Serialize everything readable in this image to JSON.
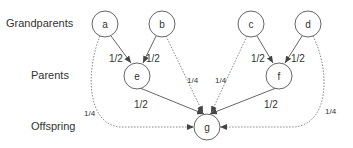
{
  "generations": [
    {
      "label": "Grandparents",
      "x": 6,
      "y": 17
    },
    {
      "label": "Parents",
      "x": 31,
      "y": 69
    },
    {
      "label": "Offspring",
      "x": 31,
      "y": 120
    }
  ],
  "nodes": {
    "a": {
      "label": "a",
      "cx": 105,
      "cy": 24
    },
    "b": {
      "label": "b",
      "cx": 162,
      "cy": 24
    },
    "c": {
      "label": "c",
      "cx": 251,
      "cy": 24
    },
    "d": {
      "label": "d",
      "cx": 308,
      "cy": 24
    },
    "e": {
      "label": "e",
      "cx": 137,
      "cy": 76
    },
    "f": {
      "label": "f",
      "cx": 279,
      "cy": 76
    },
    "g": {
      "label": "g",
      "cx": 207,
      "cy": 127
    }
  },
  "edges": {
    "a_e": {
      "weight": "1/2",
      "style": "solid"
    },
    "b_e": {
      "weight": "1/2",
      "style": "solid"
    },
    "c_f": {
      "weight": "1/2",
      "style": "solid"
    },
    "d_f": {
      "weight": "1/2",
      "style": "solid"
    },
    "e_g": {
      "weight": "1/2",
      "style": "solid"
    },
    "f_g": {
      "weight": "1/2",
      "style": "solid"
    },
    "a_g": {
      "weight": "1/4",
      "style": "dotted"
    },
    "b_g": {
      "weight": "1/4",
      "style": "dotted"
    },
    "c_g": {
      "weight": "1/4",
      "style": "dotted"
    },
    "d_g": {
      "weight": "1/4",
      "style": "dotted"
    }
  },
  "colors": {
    "stroke": "#555555",
    "text": "#333333"
  }
}
